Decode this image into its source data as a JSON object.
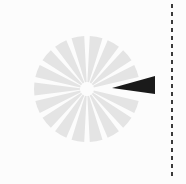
{
  "figure": {
    "name": "radial-sector-diagram",
    "title": "Radial pinwheel diagram with one highlighted sector",
    "background_color": "#fcfcfc",
    "width": 186,
    "height": 184
  },
  "disk": {
    "name": "segmented-disk",
    "center_x": 87,
    "center_y": 89,
    "radius": 53,
    "inner_radius": 7,
    "sector_count": 18,
    "sector_span_degrees": 20,
    "gap_degrees": 6,
    "fill_color": "#e4e4e4",
    "gap_color": "#fcfcfc"
  },
  "highlight": {
    "name": "highlighted-sector",
    "label": "selected sector",
    "fill_color": "#1a1a1a",
    "apex_x": 112,
    "apex_y": 88,
    "outer_x": 155,
    "outer_top_y": 76,
    "outer_bottom_y": 94,
    "direction_degrees": 0,
    "angular_width_degrees": 12
  },
  "divider": {
    "name": "vertical-dashed-divider",
    "x": 172,
    "y_start": 4,
    "y_end": 180,
    "color": "#3a3a3a",
    "stroke_width": 2,
    "dash_length": 4,
    "dash_gap": 4
  }
}
